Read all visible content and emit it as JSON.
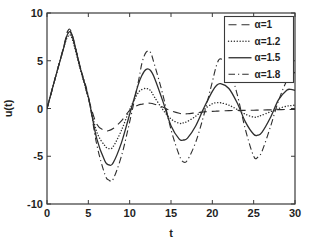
{
  "figure": {
    "background": "#ffffff",
    "axis_color": "#3a3a3a",
    "text_color": "#1f1f1f"
  },
  "chart_data": {
    "type": "line",
    "title": "",
    "xlabel": "t",
    "ylabel": "u(t)",
    "xlim": [
      0,
      30
    ],
    "ylim": [
      -10,
      10
    ],
    "x_ticks": [
      0,
      5,
      10,
      15,
      20,
      25,
      30
    ],
    "y_ticks": [
      -10,
      -5,
      0,
      5,
      10
    ],
    "grid": false,
    "legend_position": "top-right",
    "x": [
      0,
      1,
      2,
      2.5,
      3,
      4,
      5,
      6,
      7,
      7.5,
      8,
      9,
      10,
      11,
      11.5,
      12,
      12.5,
      13,
      14,
      15,
      16,
      16.5,
      17,
      18,
      19,
      20,
      20.5,
      21,
      22,
      23,
      24,
      25,
      25.5,
      26,
      27,
      28,
      29,
      29.5,
      30
    ],
    "series": [
      {
        "name": "α=1",
        "line_style": "dashed",
        "color": "#2e2e2e",
        "values": [
          0,
          3.2,
          6.4,
          8.1,
          7.9,
          4.4,
          1.1,
          -1.6,
          -2.3,
          -2.3,
          -2.1,
          -1.3,
          -0.2,
          0.35,
          0.45,
          0.55,
          0.55,
          0.45,
          0.15,
          -0.25,
          -0.5,
          -0.55,
          -0.55,
          -0.45,
          -0.35,
          -0.3,
          -0.28,
          -0.26,
          -0.22,
          -0.2,
          -0.2,
          -0.18,
          -0.17,
          -0.16,
          -0.14,
          -0.12,
          -0.11,
          -0.1,
          -0.1
        ]
      },
      {
        "name": "α=1.2",
        "line_style": "dotted",
        "color": "#2e2e2e",
        "values": [
          0,
          3.2,
          6.3,
          7.5,
          7.4,
          4.2,
          1.1,
          -2.4,
          -3.9,
          -4.2,
          -4.0,
          -2.3,
          -0.1,
          1.6,
          2.0,
          2.1,
          1.9,
          1.2,
          -0.1,
          -1.1,
          -1.55,
          -1.5,
          -1.35,
          -0.8,
          -0.1,
          0.5,
          0.6,
          0.6,
          0.35,
          -0.1,
          -0.6,
          -0.9,
          -0.85,
          -0.7,
          -0.35,
          0.0,
          0.25,
          0.3,
          0.35
        ]
      },
      {
        "name": "α=1.5",
        "line_style": "solid",
        "color": "#2e2e2e",
        "values": [
          0,
          3.2,
          6.3,
          7.8,
          7.7,
          4.3,
          1.2,
          -3.1,
          -5.5,
          -5.9,
          -5.7,
          -3.6,
          -0.6,
          2.4,
          3.5,
          4.1,
          4.0,
          3.2,
          0.8,
          -1.8,
          -3.2,
          -3.3,
          -3.1,
          -1.8,
          0.1,
          1.8,
          2.4,
          2.6,
          2.1,
          0.6,
          -1.4,
          -2.7,
          -2.8,
          -2.5,
          -1.0,
          0.9,
          1.9,
          2.0,
          1.9
        ]
      },
      {
        "name": "α=1.8",
        "line_style": "dash-dot",
        "color": "#2e2e2e",
        "values": [
          0,
          3.2,
          6.3,
          7.9,
          7.8,
          4.4,
          1.3,
          -3.7,
          -6.9,
          -7.5,
          -7.4,
          -5.0,
          -1.4,
          2.6,
          4.8,
          5.9,
          5.9,
          4.6,
          1.5,
          -2.2,
          -4.9,
          -5.6,
          -5.4,
          -3.5,
          -0.6,
          2.8,
          4.5,
          5.2,
          4.3,
          1.5,
          -2.2,
          -5.0,
          -5.1,
          -4.5,
          -2.0,
          0.8,
          2.9,
          3.4,
          3.8
        ]
      }
    ]
  }
}
